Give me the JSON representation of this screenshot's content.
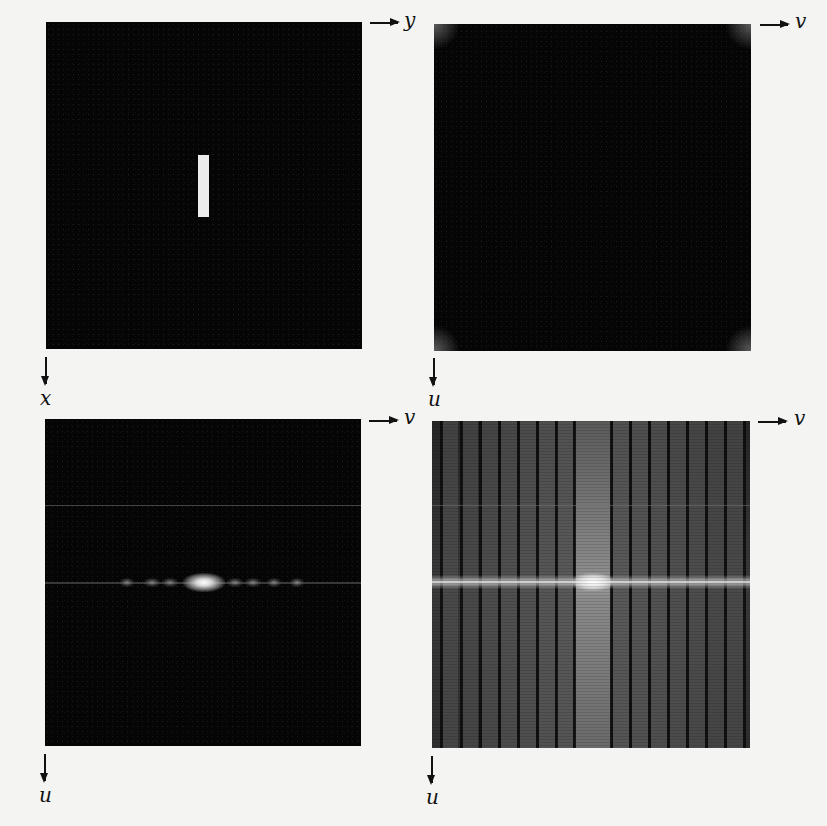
{
  "figure": {
    "panels": [
      {
        "id": "a",
        "description": "Image f(x,y) of a white vertical rectangle on black background",
        "horizontal_axis_label": "y",
        "vertical_axis_label": "x"
      },
      {
        "id": "b",
        "description": "Fourier spectrum |F(u,v)|, uncentered (energy in corners)",
        "horizontal_axis_label": "v",
        "vertical_axis_label": "u"
      },
      {
        "id": "c",
        "description": "Centered Fourier spectrum, linear display (bright central blob on horizontal axis)",
        "horizontal_axis_label": "v",
        "vertical_axis_label": "u"
      },
      {
        "id": "d",
        "description": "Centered spectrum after log transformation (vertical stripe / sinc pattern)",
        "horizontal_axis_label": "v",
        "vertical_axis_label": "u"
      }
    ]
  },
  "colors": {
    "page_background": "#f4f4f2",
    "panel_background": "#050505",
    "object_white": "#ececec",
    "axis_ink": "#111111"
  }
}
